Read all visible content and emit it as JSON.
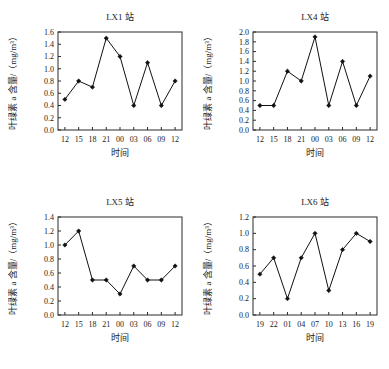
{
  "figure": {
    "panel_order": [
      "lx1",
      "lx4",
      "lx5",
      "lx6"
    ]
  },
  "chart_data": [
    {
      "id": "lx1",
      "type": "line",
      "title": "LX1 站",
      "xlabel": "时间",
      "ylabel": "叶绿素 a 含量/（mg/m³）",
      "categories": [
        "12",
        "15",
        "18",
        "21",
        "00",
        "03",
        "06",
        "09",
        "12"
      ],
      "values": [
        0.5,
        0.8,
        0.7,
        1.5,
        1.2,
        0.4,
        1.1,
        0.4,
        0.8
      ],
      "ylim": [
        0.0,
        1.6
      ],
      "ytick_step": 0.2,
      "yticks": [
        "0.0",
        "0.2",
        "0.4",
        "0.6",
        "0.8",
        "1.0",
        "1.2",
        "1.4",
        "1.6"
      ],
      "grid": false,
      "legend": "none",
      "marker": "diamond",
      "color": "#111111"
    },
    {
      "id": "lx4",
      "type": "line",
      "title": "LX4 站",
      "xlabel": "时间",
      "ylabel": "叶绿素 a 含量/（mg/m³）",
      "categories": [
        "12",
        "15",
        "18",
        "21",
        "00",
        "03",
        "06",
        "09",
        "12"
      ],
      "values": [
        0.5,
        0.5,
        1.2,
        1.0,
        1.9,
        0.5,
        1.4,
        0.5,
        1.1
      ],
      "ylim": [
        0.0,
        2.0
      ],
      "ytick_step": 0.2,
      "yticks": [
        "0.0",
        "0.2",
        "0.4",
        "0.6",
        "0.8",
        "1.0",
        "1.2",
        "1.4",
        "1.6",
        "1.8",
        "2.0"
      ],
      "grid": false,
      "legend": "none",
      "marker": "diamond",
      "color": "#111111"
    },
    {
      "id": "lx5",
      "type": "line",
      "title": "LX5 站",
      "xlabel": "时间",
      "ylabel": "叶绿素 a 含量/（mg/m³）",
      "categories": [
        "12",
        "15",
        "18",
        "21",
        "00",
        "03",
        "06",
        "09",
        "12"
      ],
      "values": [
        1.0,
        1.2,
        0.5,
        0.5,
        0.3,
        0.7,
        0.5,
        0.5,
        0.7
      ],
      "ylim": [
        0.0,
        1.4
      ],
      "ytick_step": 0.2,
      "yticks": [
        "0.0",
        "0.2",
        "0.4",
        "0.6",
        "0.8",
        "1.0",
        "1.2",
        "1.4"
      ],
      "grid": false,
      "legend": "none",
      "marker": "diamond",
      "color": "#111111"
    },
    {
      "id": "lx6",
      "type": "line",
      "title": "LX6 站",
      "xlabel": "时间",
      "ylabel": "叶绿素 a 含量/（mg/m³）",
      "categories": [
        "19",
        "22",
        "01",
        "04",
        "07",
        "10",
        "13",
        "16",
        "19"
      ],
      "values": [
        0.5,
        0.7,
        0.2,
        0.7,
        1.0,
        0.3,
        0.8,
        1.0,
        0.9
      ],
      "ylim": [
        0.0,
        1.2
      ],
      "ytick_step": 0.2,
      "yticks": [
        "0.0",
        "0.2",
        "0.4",
        "0.6",
        "0.8",
        "1.0",
        "1.2"
      ],
      "grid": false,
      "legend": "none",
      "marker": "diamond",
      "color": "#111111"
    }
  ]
}
